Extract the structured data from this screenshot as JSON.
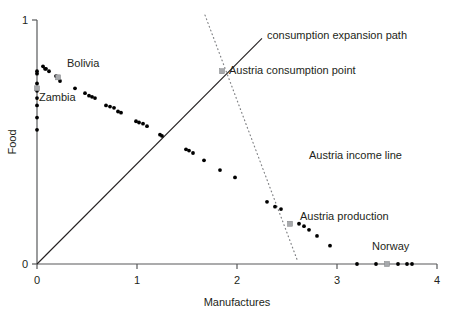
{
  "chart_data": {
    "type": "scatter",
    "title": "",
    "xlabel": "Manufactures",
    "ylabel": "Food",
    "xlim": [
      0,
      4
    ],
    "ylim": [
      0,
      1
    ],
    "xticks": [
      "0",
      "1",
      "2",
      "3",
      "4"
    ],
    "yticks": [
      "0",
      "1"
    ],
    "grid": false,
    "legend_position": "none",
    "series": [
      {
        "name": "countries",
        "marker": "dot",
        "color": "#000000",
        "points": [
          [
            0.0,
            0.79
          ],
          [
            0.0,
            0.78
          ],
          [
            0.0,
            0.74
          ],
          [
            0.0,
            0.71
          ],
          [
            0.0,
            0.68
          ],
          [
            0.0,
            0.65
          ],
          [
            0.0,
            0.6
          ],
          [
            0.0,
            0.55
          ],
          [
            0.06,
            0.81
          ],
          [
            0.08,
            0.8
          ],
          [
            0.09,
            0.8
          ],
          [
            0.12,
            0.79
          ],
          [
            0.19,
            0.77
          ],
          [
            0.23,
            0.75
          ],
          [
            0.38,
            0.72
          ],
          [
            0.48,
            0.7
          ],
          [
            0.52,
            0.69
          ],
          [
            0.55,
            0.685
          ],
          [
            0.58,
            0.68
          ],
          [
            0.69,
            0.65
          ],
          [
            0.73,
            0.645
          ],
          [
            0.77,
            0.64
          ],
          [
            0.81,
            0.625
          ],
          [
            0.84,
            0.62
          ],
          [
            0.99,
            0.585
          ],
          [
            1.02,
            0.58
          ],
          [
            1.06,
            0.575
          ],
          [
            1.1,
            0.565
          ],
          [
            1.23,
            0.53
          ],
          [
            1.25,
            0.525
          ],
          [
            1.49,
            0.47
          ],
          [
            1.52,
            0.465
          ],
          [
            1.56,
            0.455
          ],
          [
            1.67,
            0.425
          ],
          [
            1.83,
            0.385
          ],
          [
            1.98,
            0.355
          ],
          [
            2.3,
            0.255
          ],
          [
            2.38,
            0.235
          ],
          [
            2.44,
            0.225
          ],
          [
            2.62,
            0.165
          ],
          [
            2.67,
            0.155
          ],
          [
            2.72,
            0.14
          ],
          [
            2.8,
            0.115
          ],
          [
            2.93,
            0.075
          ],
          [
            3.2,
            0.0
          ],
          [
            3.39,
            0.0
          ],
          [
            3.61,
            0.0
          ],
          [
            3.7,
            0.0
          ],
          [
            3.75,
            0.0
          ]
        ]
      },
      {
        "name": "highlighted countries",
        "marker": "square",
        "color": "#a7a9ac",
        "points": [
          {
            "label": "Zambia",
            "x": 0.0,
            "y": 0.72
          },
          {
            "label": "Bolivia",
            "x": 0.21,
            "y": 0.765
          },
          {
            "label": "Austria consumption point",
            "x": 1.85,
            "y": 0.79
          },
          {
            "label": "Austria production",
            "x": 2.53,
            "y": 0.165
          },
          {
            "label": "Norway",
            "x": 3.5,
            "y": 0.0
          }
        ]
      }
    ],
    "lines": [
      {
        "name": "consumption expansion path",
        "style": "solid",
        "color": "#231f20",
        "from": [
          0.0,
          0.0
        ],
        "to": [
          2.25,
          0.925
        ]
      },
      {
        "name": "Austria income line",
        "style": "dotted",
        "color": "#808285",
        "from": [
          1.68,
          1.02
        ],
        "to": [
          2.61,
          0.008
        ]
      }
    ],
    "annotations": [
      {
        "name": "bolivia-label",
        "text": "Bolivia",
        "x": 0.3,
        "y": 0.825
      },
      {
        "name": "zambia-label",
        "text": "Zambia",
        "x": 0.02,
        "y": 0.685
      },
      {
        "name": "consumption-expansion-path-label",
        "text": "consumption expansion path",
        "x": 2.3,
        "y": 0.94
      },
      {
        "name": "austria-consumption-point-label",
        "text": "Austria consumption point",
        "x": 1.92,
        "y": 0.795
      },
      {
        "name": "austria-income-line-label",
        "text": "Austria income line",
        "x": 2.72,
        "y": 0.445
      },
      {
        "name": "austria-production-label",
        "text": "Austria production",
        "x": 2.63,
        "y": 0.195
      },
      {
        "name": "norway-label",
        "text": "Norway",
        "x": 3.35,
        "y": 0.075
      }
    ]
  }
}
